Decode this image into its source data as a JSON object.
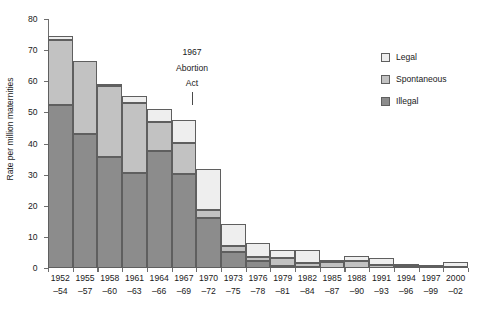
{
  "chart_data": {
    "type": "bar",
    "subtype": "stacked-vertical",
    "title": "",
    "xlabel": "",
    "ylabel": "Rate per million maternities",
    "ylim": [
      0,
      80
    ],
    "yticks": [
      0,
      10,
      20,
      30,
      40,
      50,
      60,
      70,
      80
    ],
    "grid": false,
    "legend_position": "top-right",
    "categories": [
      "1952– 54",
      "1955– 57",
      "1958– 60",
      "1961– 63",
      "1964– 66",
      "1967– 69",
      "1970– 72",
      "1973– 75",
      "1976– 78",
      "1979– 81",
      "1982– 84",
      "1985– 87",
      "1988– 90",
      "1991– 93",
      "1994– 96",
      "1997– 99",
      "2000– 02"
    ],
    "category_lines": [
      {
        "line1": "1952",
        "line2": "–54"
      },
      {
        "line1": "1955",
        "line2": "–57"
      },
      {
        "line1": "1958",
        "line2": "–60"
      },
      {
        "line1": "1961",
        "line2": "–63"
      },
      {
        "line1": "1964",
        "line2": "–66"
      },
      {
        "line1": "1967",
        "line2": "–69"
      },
      {
        "line1": "1970",
        "line2": "–72"
      },
      {
        "line1": "1973",
        "line2": "–75"
      },
      {
        "line1": "1976",
        "line2": "–78"
      },
      {
        "line1": "1979",
        "line2": "–81"
      },
      {
        "line1": "1982",
        "line2": "–84"
      },
      {
        "line1": "1985",
        "line2": "–87"
      },
      {
        "line1": "1988",
        "line2": "–90"
      },
      {
        "line1": "1991",
        "line2": "–93"
      },
      {
        "line1": "1994",
        "line2": "–96"
      },
      {
        "line1": "1997",
        "line2": "–99"
      },
      {
        "line1": "2000",
        "line2": "–02"
      }
    ],
    "series": [
      {
        "name": "Illegal",
        "color": "#8c8c8c",
        "stack_order": 0,
        "values": [
          52.5,
          43.2,
          35.7,
          30.6,
          37.7,
          30.1,
          16.1,
          5.0,
          2.2,
          0.8,
          0.3,
          0.1,
          0.1,
          0.0,
          0.0,
          0.0,
          0.0
        ]
      },
      {
        "name": "Spontaneous",
        "color": "#c2c2c2",
        "stack_order": 1,
        "values": [
          20.8,
          23.3,
          22.7,
          22.4,
          9.3,
          10.1,
          2.4,
          2.1,
          1.2,
          2.5,
          1.4,
          1.8,
          2.3,
          1.0,
          0.5,
          0.3,
          0.2
        ]
      },
      {
        "name": "Legal",
        "color": "#eeeeee",
        "stack_order": 2,
        "values": [
          1.4,
          0.0,
          0.5,
          2.2,
          4.1,
          7.3,
          13.3,
          7.0,
          4.7,
          2.6,
          4.2,
          0.3,
          1.6,
          2.3,
          0.8,
          0.7,
          1.8
        ]
      }
    ],
    "cumulative_totals": [
      74.7,
      66.5,
      58.9,
      55.2,
      51.1,
      47.5,
      31.8,
      14.1,
      8.1,
      5.9,
      5.9,
      2.2,
      4.0,
      3.3,
      1.3,
      1.0,
      2.0
    ],
    "annotations": [
      {
        "name": "abortion-act-annotation",
        "line1": "1967",
        "line2": "Abortion",
        "line3": "Act",
        "points_between_categories": [
          "1967–69",
          "1970–72"
        ]
      }
    ]
  },
  "legend": {
    "items": [
      {
        "label": "Legal",
        "color": "#eeeeee"
      },
      {
        "label": "Spontaneous",
        "color": "#c2c2c2"
      },
      {
        "label": "Illegal",
        "color": "#8c8c8c"
      }
    ]
  },
  "axes": {
    "y_title": "Rate per million maternities",
    "y_tick_labels": [
      "0",
      "10",
      "20",
      "30",
      "40",
      "50",
      "60",
      "70",
      "80"
    ]
  },
  "colors": {
    "axis": "#6e6e6e",
    "bar_outline": "#5f5f5f",
    "text": "#1a1a1a",
    "background": "#ffffff"
  }
}
